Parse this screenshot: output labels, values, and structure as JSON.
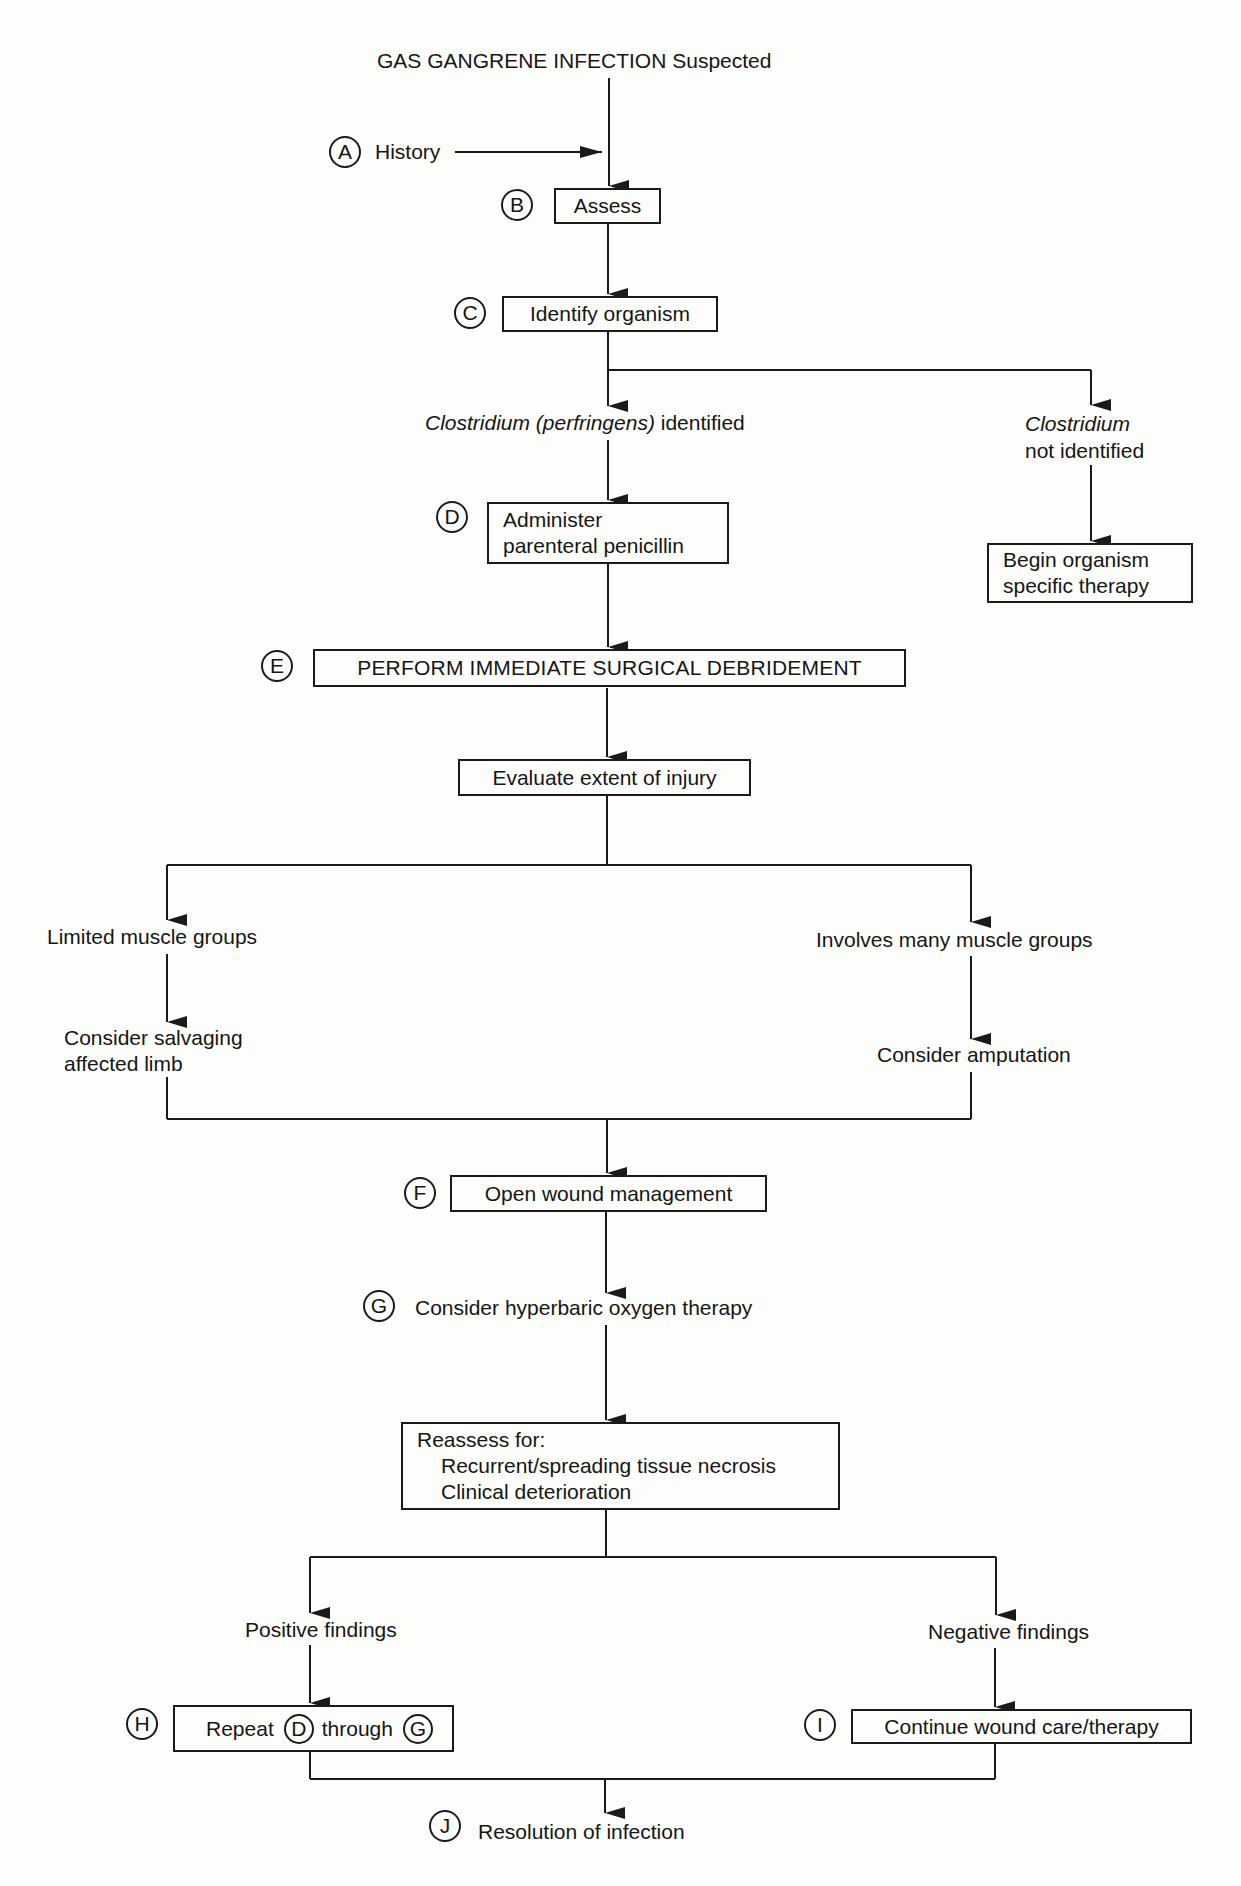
{
  "flowchart": {
    "title": "GAS GANGRENE INFECTION Suspected",
    "steps": {
      "A": {
        "marker": "A",
        "label": "History"
      },
      "B": {
        "marker": "B",
        "label": "Assess"
      },
      "C": {
        "marker": "C",
        "label": "Identify organism"
      },
      "branch_identified": {
        "italic": "Clostridium (perfringens)",
        "rest": " identified"
      },
      "branch_not_identified": {
        "italic": "Clostridium",
        "rest": "not identified"
      },
      "D": {
        "marker": "D",
        "line1": "Administer",
        "line2": "parenteral penicillin"
      },
      "not_identified_box": {
        "line1": "Begin organism",
        "line2": "specific therapy"
      },
      "E": {
        "marker": "E",
        "label": "PERFORM IMMEDIATE SURGICAL DEBRIDEMENT"
      },
      "evaluate": {
        "label": "Evaluate extent of injury"
      },
      "limited": {
        "label": "Limited muscle groups"
      },
      "salvage": {
        "line1": "Consider salvaging",
        "line2": "affected limb"
      },
      "many": {
        "label": "Involves many muscle groups"
      },
      "amputation": {
        "label": "Consider amputation"
      },
      "F": {
        "marker": "F",
        "label": "Open wound management"
      },
      "G": {
        "marker": "G",
        "label": "Consider hyperbaric oxygen therapy"
      },
      "reassess": {
        "line1": "Reassess for:",
        "line2": "Recurrent/spreading tissue necrosis",
        "line3": "Clinical deterioration"
      },
      "positive": {
        "label": "Positive findings"
      },
      "negative": {
        "label": "Negative findings"
      },
      "H": {
        "marker": "H",
        "pre": "Repeat",
        "ref1": "D",
        "mid": "through",
        "ref2": "G"
      },
      "I": {
        "marker": "I",
        "label": "Continue wound care/therapy"
      },
      "J": {
        "marker": "J",
        "label": "Resolution of infection"
      }
    }
  },
  "colors": {
    "line": "#1a1a1a",
    "background": "#fdfdfb"
  }
}
